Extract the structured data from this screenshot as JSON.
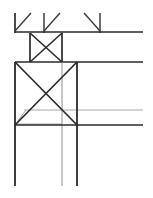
{
  "document": {
    "title": "Structural Frame Line Drawing",
    "type": "technical-line-drawing",
    "background_color": "#ffffff",
    "width": 153,
    "height": 198
  },
  "palette": {
    "dark_stroke": "#2a2a2e",
    "mid_stroke": "#3c3c41",
    "light_stroke": "#a8a8ac",
    "background": "#ffffff"
  },
  "geometry": {
    "top_band": {
      "label": "Upper chord band",
      "chord_line": {
        "x1": 15,
        "y1": 32,
        "x2": 143,
        "y2": 32,
        "color": "#2a2a2e",
        "width": 1.7
      },
      "posts": [
        {
          "name": "post-left",
          "x1": 15,
          "y1": 13,
          "x2": 15,
          "y2": 33,
          "color": "#2a2a2e",
          "width": 1.7
        },
        {
          "name": "post-mid",
          "x1": 44,
          "y1": 13,
          "x2": 44,
          "y2": 33,
          "color": "#3c3c41",
          "width": 1.5
        },
        {
          "name": "post-right",
          "x1": 100,
          "y1": 13,
          "x2": 100,
          "y2": 33,
          "color": "#3c3c41",
          "width": 1.5
        }
      ],
      "braces": [
        {
          "name": "brace-1",
          "x1": 15,
          "y1": 31,
          "x2": 31,
          "y2": 13,
          "color": "#3c3c41",
          "width": 1.4
        },
        {
          "name": "brace-2",
          "x1": 44,
          "y1": 31,
          "x2": 60,
          "y2": 13,
          "color": "#3c3c41",
          "width": 1.4
        },
        {
          "name": "brace-3",
          "x1": 84,
          "y1": 13,
          "x2": 100,
          "y2": 31,
          "color": "#3c3c41",
          "width": 1.4
        }
      ]
    },
    "small_panel": {
      "label": "Small cross-braced panel",
      "box": {
        "x": 30,
        "y": 33,
        "w": 32,
        "h": 29
      },
      "left_edge": {
        "x1": 30,
        "y1": 33,
        "x2": 30,
        "y2": 62,
        "color": "#2a2a2e",
        "width": 1.7
      },
      "right_edge": {
        "x1": 62,
        "y1": 33,
        "x2": 62,
        "y2": 62,
        "color": "#2a2a2e",
        "width": 1.7
      },
      "diagonals": [
        {
          "name": "diag-down",
          "x1": 30,
          "y1": 33,
          "x2": 62,
          "y2": 62,
          "color": "#2a2a2e",
          "width": 1.6
        },
        {
          "name": "diag-up",
          "x1": 30,
          "y1": 62,
          "x2": 62,
          "y2": 33,
          "color": "#2a2a2e",
          "width": 1.6
        }
      ]
    },
    "mid_chord": {
      "x1": 15,
      "y1": 62,
      "x2": 143,
      "y2": 62,
      "color": "#2a2a2e",
      "width": 1.7
    },
    "large_panel": {
      "label": "Large cross-braced panel",
      "box": {
        "x": 15,
        "y": 62,
        "w": 62,
        "h": 63
      },
      "left_edge": {
        "x1": 15,
        "y1": 62,
        "x2": 15,
        "y2": 186,
        "color": "#2a2a2e",
        "width": 1.8
      },
      "right_edge": {
        "x1": 77,
        "y1": 62,
        "x2": 77,
        "y2": 186,
        "color": "#2a2a2e",
        "width": 1.8
      },
      "inner_post": {
        "x1": 62,
        "y1": 62,
        "x2": 62,
        "y2": 186,
        "color": "#8e8e93",
        "width": 1.0
      },
      "diagonals": [
        {
          "name": "diag-down",
          "x1": 15,
          "y1": 62,
          "x2": 77,
          "y2": 125,
          "color": "#2a2a2e",
          "width": 1.7
        },
        {
          "name": "diag-up",
          "x1": 15,
          "y1": 125,
          "x2": 77,
          "y2": 62,
          "color": "#2a2a2e",
          "width": 1.7
        }
      ]
    },
    "light_lines": [
      {
        "name": "light-upper-rail",
        "x1": 24,
        "y1": 110,
        "x2": 143,
        "y2": 110,
        "color": "#a8a8ac",
        "width": 1.0
      },
      {
        "name": "light-lower-rail",
        "x1": 17,
        "y1": 124,
        "x2": 62,
        "y2": 124,
        "color": "#a8a8ac",
        "width": 1.0
      },
      {
        "name": "light-taper",
        "x1": 17,
        "y1": 122,
        "x2": 26,
        "y2": 110,
        "color": "#a8a8ac",
        "width": 1.0
      }
    ],
    "bottom_chord": {
      "x1": 15,
      "y1": 125,
      "x2": 143,
      "y2": 125,
      "color": "#2a2a2e",
      "width": 1.7
    },
    "bottom_posts": [
      {
        "name": "bottom-post-left",
        "x1": 15,
        "y1": 125,
        "x2": 15,
        "y2": 186,
        "color": "#2a2a2e",
        "width": 1.8
      },
      {
        "name": "bottom-post-mid",
        "x1": 62,
        "y1": 125,
        "x2": 62,
        "y2": 186,
        "color": "#8e8e93",
        "width": 1.0
      },
      {
        "name": "bottom-post-right",
        "x1": 77,
        "y1": 125,
        "x2": 77,
        "y2": 186,
        "color": "#2a2a2e",
        "width": 1.8
      }
    ]
  }
}
